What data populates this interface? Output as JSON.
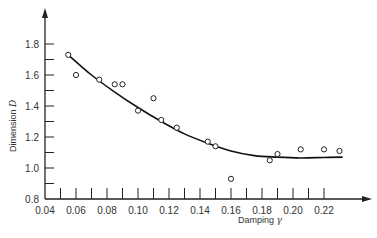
{
  "chart_data": {
    "type": "scatter",
    "title": "",
    "xlabel": "Damping γ",
    "ylabel": "Dimension D",
    "xlabel_text": "Damping ",
    "xlabel_symbol": "γ",
    "ylabel_text": "Dimension ",
    "ylabel_symbol": "D",
    "xlim": [
      0.04,
      0.24
    ],
    "ylim": [
      0.8,
      1.9
    ],
    "x_ticks": [
      0.04,
      0.06,
      0.08,
      0.1,
      0.12,
      0.14,
      0.16,
      0.18,
      0.2,
      0.22
    ],
    "x_tick_labels": [
      "0.04",
      "0.06",
      "0.08",
      "0.10",
      "0.12",
      "0.14",
      "0.16",
      "0.18",
      "0.20",
      "0.22"
    ],
    "x_minor_ticks": [
      0.05,
      0.07,
      0.09,
      0.11,
      0.13,
      0.15,
      0.17,
      0.19,
      0.21
    ],
    "y_ticks": [
      0.8,
      1.0,
      1.2,
      1.4,
      1.6,
      1.8
    ],
    "y_tick_labels": [
      "0.8",
      "1.0",
      "1.2",
      "1.4",
      "1.6",
      "1.8"
    ],
    "y_minor_ticks": [
      0.9,
      1.1,
      1.3,
      1.5,
      1.7
    ],
    "grid": false,
    "legend": null,
    "series": [
      {
        "name": "measured",
        "marker": "open-circle",
        "points": [
          [
            0.055,
            1.73
          ],
          [
            0.06,
            1.6
          ],
          [
            0.075,
            1.57
          ],
          [
            0.085,
            1.54
          ],
          [
            0.09,
            1.54
          ],
          [
            0.1,
            1.37
          ],
          [
            0.11,
            1.45
          ],
          [
            0.115,
            1.31
          ],
          [
            0.125,
            1.26
          ],
          [
            0.145,
            1.17
          ],
          [
            0.15,
            1.14
          ],
          [
            0.16,
            0.93
          ],
          [
            0.185,
            1.05
          ],
          [
            0.19,
            1.09
          ],
          [
            0.205,
            1.12
          ],
          [
            0.22,
            1.12
          ],
          [
            0.23,
            1.11
          ]
        ]
      },
      {
        "name": "fit",
        "type": "line",
        "points": [
          [
            0.055,
            1.73
          ],
          [
            0.07,
            1.6
          ],
          [
            0.085,
            1.49
          ],
          [
            0.1,
            1.39
          ],
          [
            0.115,
            1.3
          ],
          [
            0.13,
            1.22
          ],
          [
            0.145,
            1.16
          ],
          [
            0.16,
            1.11
          ],
          [
            0.175,
            1.08
          ],
          [
            0.19,
            1.07
          ],
          [
            0.205,
            1.065
          ],
          [
            0.22,
            1.068
          ],
          [
            0.232,
            1.07
          ]
        ]
      }
    ]
  }
}
